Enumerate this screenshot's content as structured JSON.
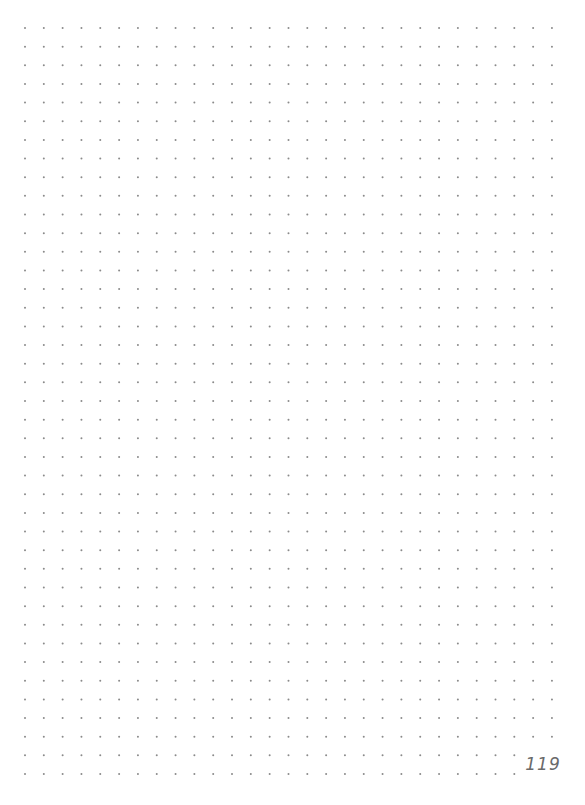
{
  "page": {
    "type": "dot-grid notebook page",
    "background_color": "#ffffff",
    "page_number": "119"
  },
  "grid": {
    "dot_color": "#8a8a8a",
    "columns": 29,
    "rows": 41,
    "origin_x": 25,
    "origin_y": 28,
    "spacing_x": 18.82,
    "spacing_y": 18.65,
    "dot_radius": 1
  }
}
